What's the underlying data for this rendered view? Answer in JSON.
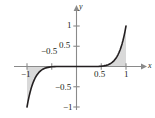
{
  "chart_data": {
    "type": "line",
    "title": "",
    "subtitle": "",
    "xlabel": "x",
    "ylabel": "y",
    "xlim": [
      -1.15,
      1.22
    ],
    "ylim": [
      -1.22,
      1.18
    ],
    "grid": false,
    "legend": null,
    "annotations": [],
    "x_ticks": [
      {
        "value": -1,
        "label": "−1"
      },
      {
        "value": -0.5,
        "label": "−0.5"
      },
      {
        "value": 0.5,
        "label": "0.5"
      },
      {
        "value": 1,
        "label": "1"
      }
    ],
    "y_ticks": [
      {
        "value": 1,
        "label": "1"
      },
      {
        "value": 0.5,
        "label": "0.5"
      },
      {
        "value": -0.5,
        "label": "−0.5"
      },
      {
        "value": -1,
        "label": "−1"
      }
    ],
    "series": [
      {
        "name": "curve",
        "color": "#231f20",
        "shaded_to_axis": true,
        "shade_color": "#d9d9d9",
        "x": [
          -1.0,
          -0.98,
          -0.96,
          -0.94,
          -0.92,
          -0.9,
          -0.88,
          -0.86,
          -0.84,
          -0.82,
          -0.8,
          -0.76,
          -0.72,
          -0.68,
          -0.64,
          -0.6,
          -0.55,
          -0.5,
          -0.45,
          -0.4,
          -0.35,
          -0.3,
          -0.25,
          -0.2,
          -0.15,
          -0.1,
          -0.05,
          0.0,
          0.05,
          0.1,
          0.15,
          0.2,
          0.25,
          0.3,
          0.35,
          0.4,
          0.45,
          0.5,
          0.55,
          0.6,
          0.64,
          0.68,
          0.72,
          0.76,
          0.8,
          0.82,
          0.84,
          0.86,
          0.88,
          0.9,
          0.92,
          0.94,
          0.96,
          0.98,
          1.0
        ],
        "y": [
          -1.0,
          -0.868,
          -0.751,
          -0.648,
          -0.558,
          -0.478,
          -0.409,
          -0.349,
          -0.296,
          -0.251,
          -0.21,
          -0.146,
          -0.1,
          -0.067,
          -0.044,
          -0.028,
          -0.015,
          -0.008,
          -0.004,
          -0.0016,
          -0.0006,
          -0.0002,
          -6e-05,
          -1e-05,
          0.0,
          0.0,
          0.0,
          0.0,
          0.0,
          0.0,
          0.0,
          1e-05,
          6e-05,
          0.0002,
          0.0006,
          0.0016,
          0.004,
          0.008,
          0.015,
          0.028,
          0.044,
          0.067,
          0.1,
          0.146,
          0.21,
          0.251,
          0.296,
          0.349,
          0.409,
          0.478,
          0.558,
          0.648,
          0.751,
          0.868,
          1.0
        ]
      }
    ]
  },
  "axes": {
    "x_axis_name": "x-axis",
    "y_axis_name": "y-axis",
    "axis_color": "#8a8a8a",
    "tick_color": "#8a8a8a"
  }
}
